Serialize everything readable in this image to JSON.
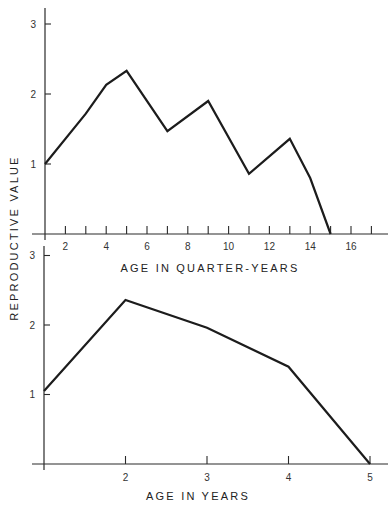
{
  "ylabel": "REPRODUCTIVE VALUE",
  "chart_data": [
    {
      "type": "line",
      "title": "",
      "xlabel": "AGE IN QUARTER-YEARS",
      "ylabel": "REPRODUCTIVE VALUE",
      "x": [
        1,
        3,
        4,
        5,
        7,
        9,
        11,
        13,
        14,
        15
      ],
      "values": [
        1.0,
        1.72,
        2.13,
        2.33,
        1.47,
        1.9,
        0.86,
        1.36,
        0.8,
        0.0
      ],
      "xlim": [
        1,
        18
      ],
      "ylim": [
        0,
        3.2
      ],
      "x_ticks": [
        2,
        3,
        4,
        5,
        6,
        7,
        8,
        9,
        10,
        11,
        12,
        13,
        14,
        15,
        16,
        17
      ],
      "x_tick_labels": [
        "2",
        "4",
        "6",
        "8",
        "10",
        "12",
        "14",
        "16"
      ],
      "y_ticks": [
        1,
        2,
        3
      ],
      "y_tick_labels": [
        "1",
        "2",
        "3"
      ],
      "grid": false,
      "legend": null
    },
    {
      "type": "line",
      "title": "",
      "xlabel": "AGE IN YEARS",
      "ylabel": "REPRODUCTIVE VALUE",
      "x": [
        1,
        2,
        3,
        4,
        5
      ],
      "values": [
        1.05,
        2.36,
        1.96,
        1.4,
        0.0
      ],
      "xlim": [
        1,
        5.2
      ],
      "ylim": [
        0,
        3.1
      ],
      "x_ticks": [
        2,
        3,
        4,
        5
      ],
      "x_tick_labels": [
        "2",
        "3",
        "4",
        "5"
      ],
      "y_ticks": [
        1,
        2,
        3
      ],
      "y_tick_labels": [
        "1",
        "2",
        "3"
      ],
      "grid": false,
      "legend": null
    }
  ]
}
